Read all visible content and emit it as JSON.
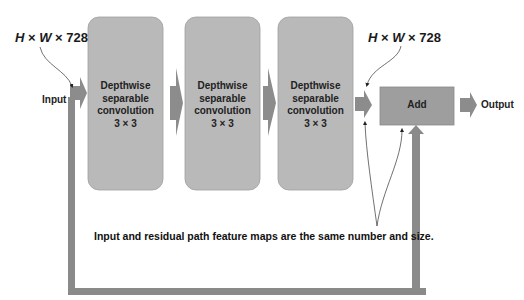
{
  "diagram": {
    "input_dim": {
      "h": "H",
      "x1": " × ",
      "w": "W",
      "x2": " × ",
      "c": "728"
    },
    "output_dim": {
      "h": "H",
      "x1": " × ",
      "w": "W",
      "x2": " × ",
      "c": "728"
    },
    "input_label": "Input",
    "output_label": "Output",
    "blocks": [
      {
        "line1": "Depthwise",
        "line2": "separable",
        "line3": "convolution",
        "line4": "3 × 3"
      },
      {
        "line1": "Depthwise",
        "line2": "separable",
        "line3": "convolution",
        "line4": "3 × 3"
      },
      {
        "line1": "Depthwise",
        "line2": "separable",
        "line3": "convolution",
        "line4": "3 × 3"
      }
    ],
    "add_label": "Add",
    "annotation": "Input and residual path feature maps are the same number and size.",
    "colors": {
      "block_fill": "#b9b9b9",
      "arrow_fill": "#8c8c8c",
      "add_fill": "#9e9e9e",
      "skip_path": "#8a8a8a"
    }
  }
}
